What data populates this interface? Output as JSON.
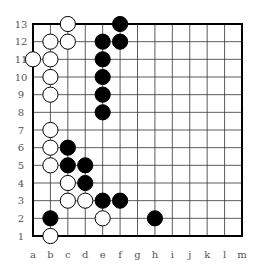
{
  "diagram": {
    "type": "go-board",
    "size": 13,
    "columns": [
      "a",
      "b",
      "c",
      "d",
      "e",
      "f",
      "g",
      "h",
      "i",
      "j",
      "k",
      "l",
      "m"
    ],
    "rows": [
      "13",
      "12",
      "11",
      "10",
      "9",
      "8",
      "7",
      "6",
      "5",
      "4",
      "3",
      "2",
      "1"
    ],
    "colors": {
      "line": "#333333",
      "border": "#000000",
      "black": "#000000",
      "white": "#ffffff",
      "label": "#555555"
    },
    "stones": {
      "white": [
        "c13",
        "b12",
        "c12",
        "a11",
        "b11",
        "b10",
        "b9",
        "b7",
        "b6",
        "b5",
        "c4",
        "c3",
        "d3",
        "e2",
        "b1"
      ],
      "black": [
        "f13",
        "e12",
        "f12",
        "e11",
        "e10",
        "e9",
        "e8",
        "c6",
        "c5",
        "d5",
        "d4",
        "e3",
        "f3",
        "b2",
        "h2"
      ]
    }
  }
}
